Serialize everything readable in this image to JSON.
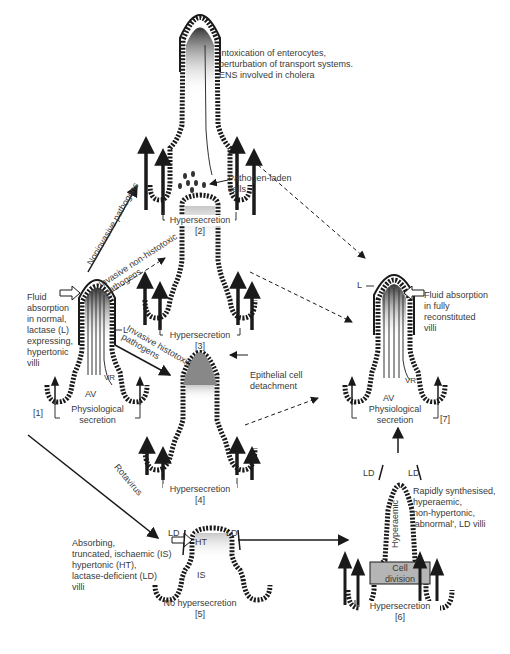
{
  "panels": {
    "p1": {
      "id": "[1]",
      "description": "Fluid\nabsorption\nin normal,\nlactase (L)\nexpressing,\nhypertonic\nvilli",
      "secretion": "Physiological\nsecretion",
      "L": "L",
      "AV": "AV",
      "VR": "VR"
    },
    "p2": {
      "id": "[2]",
      "description": "Intoxication of enterocytes,\nperturbation of transport systems.\nENS involved in cholera",
      "secretion": "Hypersecretion"
    },
    "p3": {
      "id": "[3]",
      "description": "Pathogen-laden\ncells",
      "secretion": "Hypersecretion"
    },
    "p4": {
      "id": "[4]",
      "description": "Epithelial cell\ndetachment",
      "secretion": "Hypersecretion"
    },
    "p5": {
      "id": "[5]",
      "description": "Absorbing,\ntruncated, ischaemic (IS)\nhypertonic (HT),\nlactase-deficient (LD)\nvilli",
      "secretion": "No hypersecretion",
      "HT": "HT",
      "IS": "IS",
      "LD_left": "LD",
      "LD_right": "LD"
    },
    "p6": {
      "id": "[6]",
      "description": "Rapidly synthesised,\nhyperaemic,\nnon-hypertonic,\n'abnormal', LD villi",
      "secretion": "Hypersecretion",
      "hyperaemic": "Hyperaemic",
      "cell_division": "Cell\ndivision",
      "LD_left": "LD",
      "LD_right": "LD"
    },
    "p7": {
      "id": "[7]",
      "description": "Fluid absorption\nin fully\nreconstituted\nvilli",
      "secretion": "Physiological\nsecretion",
      "L": "L",
      "AV": "AV",
      "VR": "VR"
    }
  },
  "pathways": {
    "noninvasive": "Noninvasive pathogens",
    "invasive_non_histotoxic": "Invasive non-histotoxic\npathogens",
    "invasive_histotoxic": "Invasive histotoxic\npathogens",
    "rotavirus": "Rotavirus"
  },
  "colors": {
    "line": "#1a1a1a",
    "text": "#3a3a3a",
    "shade": "#9a9a9a",
    "cell_division_fill": "#b5b5b5"
  }
}
